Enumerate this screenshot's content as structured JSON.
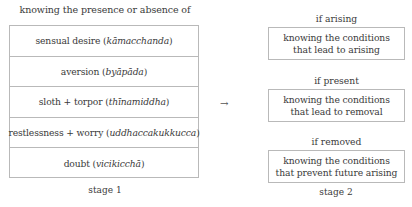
{
  "stage1": {
    "title": "knowing the presence or absence of",
    "rows": [
      {
        "label": "sensual desire",
        "pali": "kāmacchanda"
      },
      {
        "label": "aversion",
        "pali": "byāpāda"
      },
      {
        "label": "sloth + torpor",
        "pali": "thīnamiddha"
      },
      {
        "label": "restlessness + worry",
        "pali": "uddhaccakukkucca"
      },
      {
        "label": "doubt",
        "pali": "vicikicchā"
      }
    ],
    "caption": "stage 1"
  },
  "connector": {
    "arrow": "→"
  },
  "stage2": {
    "items": [
      {
        "heading": "if arising",
        "line1": "knowing the conditions",
        "line2": "that lead to arising"
      },
      {
        "heading": "if present",
        "line1": "knowing the conditions",
        "line2": "that lead to removal"
      },
      {
        "heading": "if removed",
        "line1": "knowing the conditions",
        "line2": "that prevent future arising"
      }
    ],
    "caption": "stage 2"
  },
  "colors": {
    "text": "#3a3a3a",
    "border": "#b9b9b9",
    "background": "#ffffff"
  }
}
